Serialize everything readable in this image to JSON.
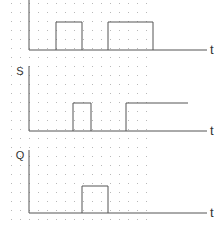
{
  "diagram": {
    "type": "timing-diagram",
    "time_axis_label": "t",
    "grid": {
      "x_start": 11,
      "x_end": 154,
      "y_start": 3,
      "y_end": 224,
      "spacing": 9,
      "color": "#b8b8b8"
    },
    "line_color": "#555555",
    "signals": [
      {
        "name": "R",
        "label": "",
        "axis_x": 29,
        "axis_top": 0,
        "baseline": 50,
        "high": 22,
        "end_x": 207,
        "pulses": [
          {
            "rise": 56,
            "fall": 82
          },
          {
            "rise": 108,
            "fall": 153
          }
        ],
        "hold_high_from": null
      },
      {
        "name": "S",
        "label": "S",
        "axis_x": 29,
        "axis_top": 66,
        "baseline": 131,
        "high": 103,
        "end_x": 207,
        "pulses": [
          {
            "rise": 73,
            "fall": 91
          }
        ],
        "hold_high_from": 126,
        "hold_high_to": 188
      },
      {
        "name": "Q",
        "label": "Q",
        "axis_x": 29,
        "axis_top": 150,
        "baseline": 213,
        "high": 186,
        "end_x": 207,
        "pulses": [
          {
            "rise": 82,
            "fall": 108
          }
        ],
        "hold_high_from": null
      }
    ]
  }
}
